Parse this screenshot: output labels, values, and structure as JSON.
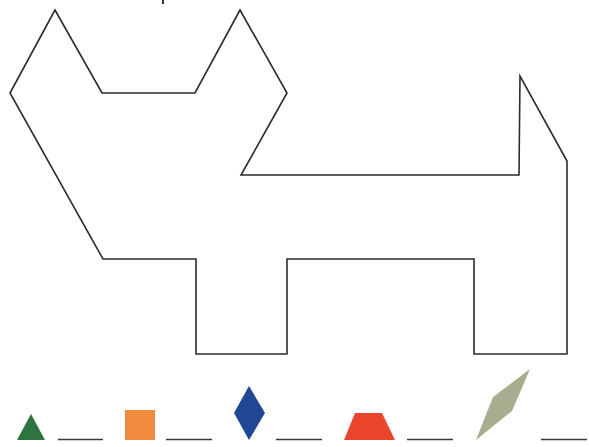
{
  "puzzle": {
    "type": "pattern-block-outline",
    "subject": "cat",
    "outline_color": "#2b2b2b"
  },
  "shape_key": {
    "items": [
      {
        "id": "triangle",
        "name": "green triangle",
        "color": "#2e7340",
        "answer": ""
      },
      {
        "id": "square",
        "name": "orange square",
        "color": "#f08a3c",
        "answer": ""
      },
      {
        "id": "rhombus",
        "name": "blue rhombus",
        "color": "#1f4793",
        "answer": ""
      },
      {
        "id": "trapezoid",
        "name": "red trapezoid",
        "color": "#e8452a",
        "answer": ""
      },
      {
        "id": "thin-rhombus",
        "name": "tan thin rhombus",
        "color": "#a9ad8f",
        "answer": ""
      }
    ],
    "answer_line_color": "#3a3a3a"
  }
}
